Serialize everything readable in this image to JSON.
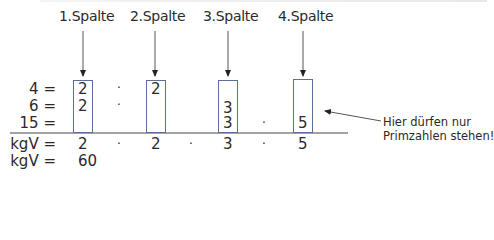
{
  "columns": [
    {
      "label": "1.Spalte"
    },
    {
      "label": "2.Spalte"
    },
    {
      "label": "3.Spalte"
    },
    {
      "label": "4.Spalte"
    }
  ],
  "rows": [
    {
      "label": "4 =",
      "cells": [
        "2",
        "2",
        "",
        ""
      ]
    },
    {
      "label": "6 =",
      "cells": [
        "2",
        "",
        "3",
        ""
      ]
    },
    {
      "label": "15 =",
      "cells": [
        "",
        "",
        "3",
        "5"
      ]
    }
  ],
  "dots": {
    "symbol": "·"
  },
  "result_row": {
    "label": "kgV =",
    "cells": [
      "2",
      "2",
      "3",
      "5"
    ]
  },
  "final_row": {
    "label": "kgV =",
    "value": "60"
  },
  "annotation": {
    "line1": "Hier dürfen nur",
    "line2": "Primzahlen stehen!"
  },
  "colors": {
    "box_border": "#5a6f9a",
    "text": "#2a2a2a",
    "line": "#444444"
  }
}
